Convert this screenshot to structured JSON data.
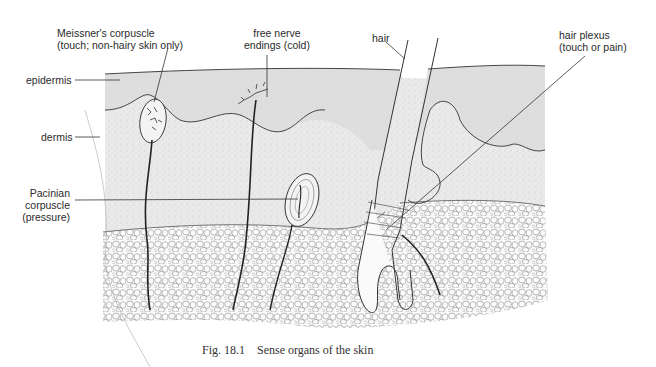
{
  "figure": {
    "number": "Fig. 18.1",
    "caption": "Sense organs of the skin",
    "layers": [
      "epidermis",
      "dermis",
      "subcutaneous fat"
    ]
  },
  "labels": {
    "meissner": {
      "line1": "Meissner's corpuscle",
      "line2": "(touch; non-hairy skin only)"
    },
    "free_nerve": {
      "line1": "free nerve",
      "line2": "endings (cold)"
    },
    "hair": "hair",
    "hair_plexus": {
      "line1": "hair plexus",
      "line2": "(touch or pain)"
    },
    "epidermis": "epidermis",
    "dermis": "dermis",
    "pacinian": {
      "line1": "Pacinian",
      "line2": "corpuscle",
      "line3": "(pressure)"
    }
  },
  "colors": {
    "epidermis_fill": "#e2e2e2",
    "dermis_fill": "#ececec",
    "fat_cell_stroke": "#8a8a8a",
    "line": "#2a2a2a",
    "background": "#ffffff"
  }
}
